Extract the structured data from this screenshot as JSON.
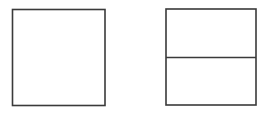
{
  "canvas": {
    "width": 272,
    "height": 114,
    "background_color": "#ffffff",
    "description": "Line drawing of two geometric figures: an undivided square and a square divided into two horizontal parts"
  },
  "style": {
    "stroke_color": "#3a3a3a",
    "stroke_color_soft": "#555555",
    "stroke_width": 1.6,
    "divider_stroke_width": 1.6,
    "fill_color": "#ffffff"
  },
  "figures": [
    {
      "id": "left-square",
      "name": "undivided-square",
      "label": "",
      "x": 12.5,
      "y": 9.5,
      "width": 92.5,
      "height": 96.0,
      "divisions": 1,
      "divider_lines": []
    },
    {
      "id": "right-square",
      "name": "divided-square",
      "label": "",
      "x": 166.0,
      "y": 9.0,
      "width": 90.0,
      "height": 96.0,
      "divisions": 2,
      "divider_lines": [
        {
          "orientation": "horizontal",
          "y": 57.5,
          "x1": 166.0,
          "x2": 256.0
        }
      ]
    }
  ]
}
